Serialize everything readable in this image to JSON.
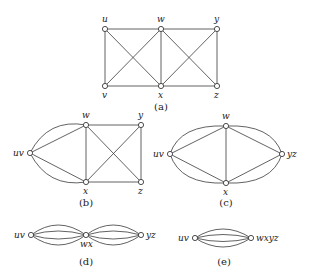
{
  "figure": {
    "panels": [
      {
        "id": "a",
        "caption": "(a)",
        "nodes": [
          {
            "label": "u",
            "x": 105,
            "y": 29
          },
          {
            "label": "w",
            "x": 161,
            "y": 29
          },
          {
            "label": "y",
            "x": 217,
            "y": 29
          },
          {
            "label": "v",
            "x": 105,
            "y": 86
          },
          {
            "label": "x",
            "x": 161,
            "y": 86
          },
          {
            "label": "z",
            "x": 217,
            "y": 86
          }
        ],
        "edges": [
          [
            "u",
            "w"
          ],
          [
            "w",
            "y"
          ],
          [
            "v",
            "x"
          ],
          [
            "x",
            "z"
          ],
          [
            "u",
            "v"
          ],
          [
            "w",
            "x"
          ],
          [
            "y",
            "z"
          ],
          [
            "u",
            "x"
          ],
          [
            "v",
            "w"
          ],
          [
            "w",
            "z"
          ],
          [
            "x",
            "y"
          ]
        ]
      },
      {
        "id": "b",
        "caption": "(b)",
        "nodes": [
          {
            "label": "uv",
            "x": 30,
            "y": 153
          },
          {
            "label": "w",
            "x": 86,
            "y": 125
          },
          {
            "label": "y",
            "x": 141,
            "y": 125
          },
          {
            "label": "x",
            "x": 86,
            "y": 182
          },
          {
            "label": "z",
            "x": 141,
            "y": 182
          }
        ],
        "edges": [
          [
            "uv",
            "w"
          ],
          [
            "uv",
            "w"
          ],
          [
            "uv",
            "x"
          ],
          [
            "uv",
            "x"
          ],
          [
            "w",
            "y"
          ],
          [
            "x",
            "z"
          ],
          [
            "w",
            "x"
          ],
          [
            "y",
            "z"
          ],
          [
            "w",
            "z"
          ],
          [
            "x",
            "y"
          ]
        ]
      },
      {
        "id": "c",
        "caption": "(c)",
        "nodes": [
          {
            "label": "uv",
            "x": 170,
            "y": 154
          },
          {
            "label": "w",
            "x": 226,
            "y": 126
          },
          {
            "label": "x",
            "x": 226,
            "y": 183
          },
          {
            "label": "yz",
            "x": 282,
            "y": 154
          }
        ],
        "edges": [
          [
            "uv",
            "w"
          ],
          [
            "uv",
            "w"
          ],
          [
            "uv",
            "x"
          ],
          [
            "uv",
            "x"
          ],
          [
            "w",
            "yz"
          ],
          [
            "w",
            "yz"
          ],
          [
            "x",
            "yz"
          ],
          [
            "x",
            "yz"
          ],
          [
            "w",
            "x"
          ]
        ]
      },
      {
        "id": "d",
        "caption": "(d)",
        "nodes": [
          {
            "label": "uv",
            "x": 31,
            "y": 235
          },
          {
            "label": "wx",
            "x": 86,
            "y": 235
          },
          {
            "label": "yz",
            "x": 141,
            "y": 235
          }
        ],
        "edges": [
          [
            "uv",
            "wx"
          ],
          [
            "uv",
            "wx"
          ],
          [
            "uv",
            "wx"
          ],
          [
            "uv",
            "wx"
          ],
          [
            "wx",
            "yz"
          ],
          [
            "wx",
            "yz"
          ],
          [
            "wx",
            "yz"
          ],
          [
            "wx",
            "yz"
          ]
        ]
      },
      {
        "id": "e",
        "caption": "(e)",
        "nodes": [
          {
            "label": "uv",
            "x": 195,
            "y": 238
          },
          {
            "label": "wxyz",
            "x": 251,
            "y": 238
          }
        ],
        "edges": [
          [
            "uv",
            "wxyz"
          ],
          [
            "uv",
            "wxyz"
          ],
          [
            "uv",
            "wxyz"
          ],
          [
            "uv",
            "wxyz"
          ]
        ]
      }
    ]
  }
}
